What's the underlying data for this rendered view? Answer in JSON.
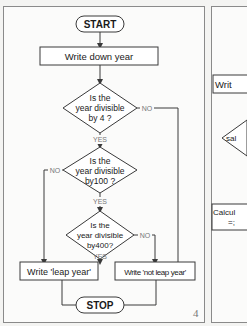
{
  "left_flowchart": {
    "start": "START",
    "step1": "Write down year",
    "decision1": [
      "Is the",
      "year divisible",
      "by 4 ?"
    ],
    "decision2": [
      "Is the",
      "year divisible",
      "by100 ?"
    ],
    "decision3": [
      "Is the",
      "year divisible",
      "by400?"
    ],
    "yes_label": "YES",
    "no_label": "NO",
    "out_leap": "Write 'leap year'",
    "out_not_leap": "Write 'not leap year'",
    "stop": "STOP",
    "page_number": "4"
  },
  "right_flowchart_partial": {
    "box1": "Writ",
    "diamond": "sal",
    "box2_line1": "Calcul",
    "box2_line2": "=;"
  },
  "colors": {
    "line": "#3a3a3a",
    "label_gray": "#777777",
    "background": "#fbfbfa"
  }
}
